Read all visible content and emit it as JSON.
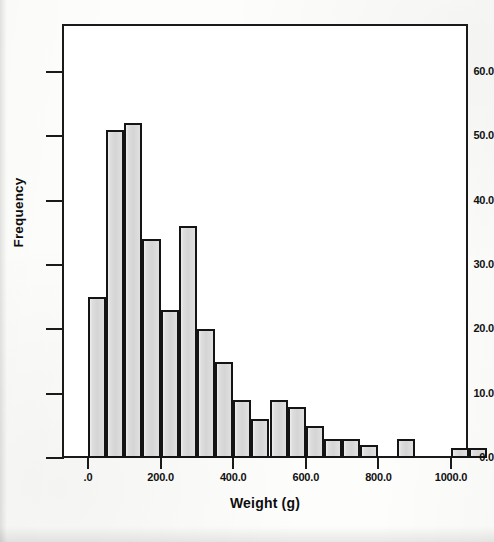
{
  "chart_data": {
    "type": "bar",
    "title": "",
    "subtitle": "",
    "xlabel": "Weight (g)",
    "ylabel": "Frequency",
    "xlim": [
      -50,
      1000
    ],
    "ylim": [
      0,
      65
    ],
    "grid": false,
    "legend_position": "right",
    "bin_width": 50,
    "x_ticks": [
      {
        "value": 0,
        "label": ".0"
      },
      {
        "value": 200,
        "label": "200.0"
      },
      {
        "value": 400,
        "label": "400.0"
      },
      {
        "value": 600,
        "label": "600.0"
      },
      {
        "value": 800,
        "label": "800.0"
      },
      {
        "value": 1000,
        "label": "1000.0"
      }
    ],
    "y_ticks": [
      {
        "value": 0,
        "label": "0.0"
      },
      {
        "value": 10,
        "label": "10.0"
      },
      {
        "value": 20,
        "label": "20.0"
      },
      {
        "value": 30,
        "label": "30.0"
      },
      {
        "value": 40,
        "label": "40.0"
      },
      {
        "value": 50,
        "label": "50.0"
      },
      {
        "value": 60,
        "label": "60.0"
      }
    ],
    "bins": [
      {
        "start": 0,
        "end": 50,
        "value": 25
      },
      {
        "start": 50,
        "end": 100,
        "value": 51
      },
      {
        "start": 100,
        "end": 150,
        "value": 52
      },
      {
        "start": 150,
        "end": 200,
        "value": 34
      },
      {
        "start": 200,
        "end": 250,
        "value": 23
      },
      {
        "start": 250,
        "end": 300,
        "value": 36
      },
      {
        "start": 300,
        "end": 350,
        "value": 20
      },
      {
        "start": 350,
        "end": 400,
        "value": 15
      },
      {
        "start": 400,
        "end": 450,
        "value": 9
      },
      {
        "start": 450,
        "end": 500,
        "value": 6
      },
      {
        "start": 500,
        "end": 550,
        "value": 9
      },
      {
        "start": 550,
        "end": 600,
        "value": 8
      },
      {
        "start": 600,
        "end": 650,
        "value": 5
      },
      {
        "start": 650,
        "end": 700,
        "value": 3
      },
      {
        "start": 700,
        "end": 750,
        "value": 3
      },
      {
        "start": 750,
        "end": 800,
        "value": 2
      },
      {
        "start": 800,
        "end": 850,
        "value": 0
      },
      {
        "start": 850,
        "end": 900,
        "value": 3
      },
      {
        "start": 900,
        "end": 950,
        "value": 0
      },
      {
        "start": 950,
        "end": 1000,
        "value": 0
      },
      {
        "start": 1000,
        "end": 1050,
        "value": 1.5
      },
      {
        "start": 1050,
        "end": 1100,
        "value": 1.5
      }
    ],
    "categories": [
      "0-50",
      "50-100",
      "100-150",
      "150-200",
      "200-250",
      "250-300",
      "300-350",
      "350-400",
      "400-450",
      "450-500",
      "500-550",
      "550-600",
      "600-650",
      "650-700",
      "700-750",
      "750-800",
      "800-850",
      "850-900",
      "900-950",
      "950-1000",
      "1000-1050",
      "1050-1100"
    ],
    "values": [
      25,
      51,
      52,
      34,
      23,
      36,
      20,
      15,
      9,
      6,
      9,
      8,
      5,
      3,
      3,
      2,
      0,
      3,
      0,
      0,
      1.5,
      1.5
    ],
    "bar_fill_color": "#d9d9d9",
    "bar_edge_color": "#141414",
    "axis_color": "#1a1a1a",
    "background_color": "#ffffff"
  },
  "legend": {
    "lines": [
      "",
      "",
      ""
    ],
    "lower_lines": [
      "",
      ""
    ]
  }
}
